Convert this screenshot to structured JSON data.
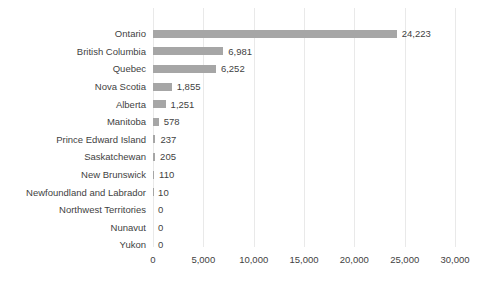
{
  "chart_data": {
    "type": "bar",
    "orientation": "horizontal",
    "categories": [
      "Ontario",
      "British Columbia",
      "Quebec",
      "Nova Scotia",
      "Alberta",
      "Manitoba",
      "Prince Edward Island",
      "Saskatchewan",
      "New Brunswick",
      "Newfoundland and Labrador",
      "Northwest Territories",
      "Nunavut",
      "Yukon"
    ],
    "values": [
      24223,
      6981,
      6252,
      1855,
      1251,
      578,
      237,
      205,
      110,
      10,
      0,
      0,
      0
    ],
    "value_labels": [
      "24,223",
      "6,981",
      "6,252",
      "1,855",
      "1,251",
      "578",
      "237",
      "205",
      "110",
      "10",
      "0",
      "0",
      "0"
    ],
    "x_tick_labels": [
      "0",
      "5,000",
      "10,000",
      "15,000",
      "20,000",
      "25,000",
      "30,000"
    ],
    "x_tick_values": [
      0,
      5000,
      10000,
      15000,
      20000,
      25000,
      30000
    ],
    "xlim": [
      0,
      30000
    ],
    "grid": "vertical-gridlines",
    "legend": "none"
  },
  "colors": {
    "bar": "#a6a6a6",
    "grid": "#e9e9e9",
    "text": "#3f3f3f",
    "background": "#ffffff"
  }
}
